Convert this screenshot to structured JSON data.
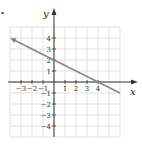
{
  "chart_data": {
    "type": "line",
    "title": "",
    "xlabel": "x",
    "ylabel": "y",
    "xlim": [
      -4,
      6
    ],
    "ylim": [
      -5,
      5
    ],
    "grid": true,
    "x_ticks": [
      -3,
      -2,
      -1,
      1,
      2,
      3,
      4
    ],
    "y_ticks": [
      -4,
      -3,
      -2,
      -1,
      1,
      2,
      3,
      4
    ],
    "x_tick_labels": [
      "−3",
      "−2",
      "−1",
      "1",
      "2",
      "3",
      "4"
    ],
    "y_tick_labels": [
      "−4",
      "−3",
      "−2",
      "−1",
      "1",
      "2",
      "3",
      "4"
    ],
    "series": [
      {
        "name": "line",
        "x": [
          -4,
          0,
          4,
          6
        ],
        "y": [
          4,
          2,
          0,
          -1
        ],
        "color": "#888888",
        "arrow_start": true
      }
    ],
    "legend": null
  },
  "bullet": "•"
}
